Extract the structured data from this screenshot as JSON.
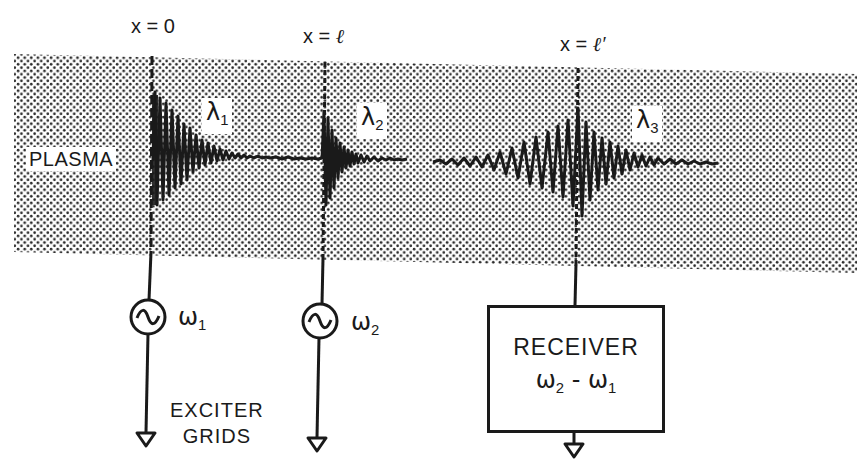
{
  "diagram": {
    "type": "plasma-wave-echo-experiment",
    "medium_label": "PLASMA",
    "positions": [
      {
        "id": "x0",
        "text": "x = 0",
        "var": "x",
        "eq": " = ",
        "val": "0"
      },
      {
        "id": "xl",
        "text": "x = ℓ",
        "var": "x",
        "eq": " = ",
        "val": "ℓ"
      },
      {
        "id": "xl_prime",
        "text": "x = ℓ′",
        "var": "x",
        "eq": " = ",
        "val": "ℓ′"
      }
    ],
    "waves": [
      {
        "id": "lambda1",
        "symbol": "λ",
        "subscript": "1",
        "shape": "damped-decay-from-grid-1"
      },
      {
        "id": "lambda2",
        "symbol": "λ",
        "subscript": "2",
        "shape": "damped-decay-from-grid-2"
      },
      {
        "id": "lambda3",
        "symbol": "λ",
        "subscript": "3",
        "shape": "echo-burst-at-receiver"
      }
    ],
    "sources": [
      {
        "id": "osc1",
        "icon": "ac-source-icon",
        "symbol": "ω",
        "subscript": "1"
      },
      {
        "id": "osc2",
        "icon": "ac-source-icon",
        "symbol": "ω",
        "subscript": "2"
      }
    ],
    "exciter_label_line1": "EXCITER",
    "exciter_label_line2": "GRIDS",
    "receiver": {
      "title": "RECEIVER",
      "formula_a_symbol": "ω",
      "formula_a_sub": "2",
      "formula_op": " - ",
      "formula_b_symbol": "ω",
      "formula_b_sub": "1"
    },
    "colors": {
      "ink": "#1a1a1a",
      "plasma_dots": "#2a2a2a",
      "background": "#ffffff"
    }
  }
}
